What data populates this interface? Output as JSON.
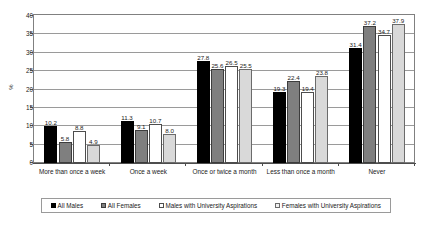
{
  "chart_data": {
    "type": "bar",
    "title": "",
    "subtitle": "",
    "xlabel": "",
    "ylabel": "%",
    "ylim": [
      0,
      40
    ],
    "ytick_step": 5,
    "yticks": [
      0,
      5,
      10,
      15,
      20,
      25,
      30,
      35,
      40
    ],
    "grid": true,
    "legend_position": "bottom",
    "categories": [
      "More than once a week",
      "Once a week",
      "Once or twice a month",
      "Less than once a month",
      "Never"
    ],
    "series": [
      {
        "name": "All Males",
        "color": "#000000",
        "values": [
          10.2,
          11.3,
          27.8,
          19.3,
          31.4
        ],
        "labels": [
          "10.2",
          "11.3",
          "27.8",
          "19.3",
          "31.4"
        ]
      },
      {
        "name": "All Females",
        "color": "#7f7f7f",
        "values": [
          5.8,
          9.1,
          25.6,
          22.4,
          37.2
        ],
        "labels": [
          "5.8",
          "9.1",
          "25.6",
          "22.4",
          "37.2"
        ]
      },
      {
        "name": "Males with University Aspirations",
        "color": "#ffffff",
        "values": [
          8.8,
          10.7,
          26.5,
          19.4,
          34.7
        ],
        "labels": [
          "8.8",
          "10.7",
          "26.5",
          "19.4",
          "34.7"
        ]
      },
      {
        "name": "Females with University Aspirations",
        "color": "#d9d9d9",
        "values": [
          4.9,
          8.0,
          25.5,
          23.8,
          37.9
        ],
        "labels": [
          "4.9",
          "8.0",
          "25.5",
          "23.8",
          "37.9"
        ]
      }
    ]
  }
}
